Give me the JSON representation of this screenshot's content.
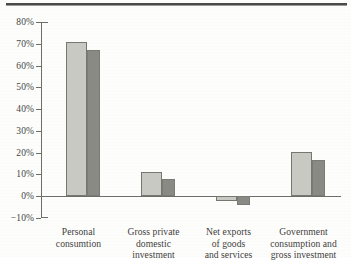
{
  "chart_data": {
    "type": "bar",
    "title": "",
    "subtitle": "",
    "xlabel": "",
    "ylabel": "",
    "ylim": [
      -10,
      80
    ],
    "grid": false,
    "legend": "none",
    "categories": [
      "Personal consumtion",
      "Gross private domestic investment",
      "Net exports of goods and services",
      "Government consumption and gross investment"
    ],
    "category_label_lines": [
      [
        "Personal",
        "consumtion"
      ],
      [
        "Gross private",
        "domestic",
        "investment"
      ],
      [
        "Net exports",
        "of goods",
        "and services"
      ],
      [
        "Government",
        "consumption and",
        "gross investment"
      ]
    ],
    "ytick_labels": [
      "80%",
      "70%",
      "60%",
      "50%",
      "40%",
      "30%",
      "20%",
      "10%",
      "0%",
      "−10%"
    ],
    "ytick_values": [
      80,
      70,
      60,
      50,
      40,
      30,
      20,
      10,
      0,
      -10
    ],
    "series": [
      {
        "name": "series-1",
        "color": "#c9c9c4",
        "values": [
          71,
          11,
          -2,
          20.5
        ]
      },
      {
        "name": "series-2",
        "color": "#8a8a85",
        "values": [
          67,
          8,
          -4,
          16.5
        ]
      }
    ]
  },
  "axes": {
    "zero_label": "0%"
  }
}
